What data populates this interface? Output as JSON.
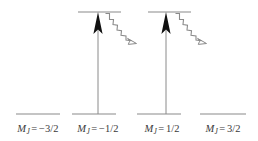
{
  "figure": {
    "type": "energy-level-diagram",
    "title": "",
    "colors": {
      "level_line": "#8a8a8a",
      "excitation_arrow": "#1a1a1a",
      "emission_arrow": "#8a8a8a",
      "label_text": "#3a3a3a",
      "background": "#ffffff"
    },
    "sublevels": [
      {
        "id": "mj-minus-3-2",
        "m_symbol": "M",
        "m_subscript": "J",
        "equals": "=",
        "value": "−3/2",
        "label_text": "M_J = −3/2",
        "ground_line": {
          "x1": 16,
          "x2": 60,
          "y": 114
        },
        "excited_line": null,
        "has_excitation_arrow": false,
        "has_emission_arrow": false,
        "label_center_x": 38,
        "label_y": 124
      },
      {
        "id": "mj-minus-1-2",
        "m_symbol": "M",
        "m_subscript": "J",
        "equals": "=",
        "value": "−1/2",
        "label_text": "M_J = −1/2",
        "ground_line": {
          "x1": 72,
          "x2": 116,
          "y": 114
        },
        "excited_line": {
          "x1": 78,
          "x2": 121,
          "y": 12
        },
        "has_excitation_arrow": true,
        "has_emission_arrow": true,
        "arrow_x": 98,
        "arrow_y_bottom": 114,
        "arrow_y_top": 12,
        "emission": {
          "x1": 105,
          "y1": 13,
          "x2": 136,
          "y2": 40
        },
        "label_center_x": 98,
        "label_y": 124
      },
      {
        "id": "mj-plus-1-2",
        "m_symbol": "M",
        "m_subscript": "J",
        "equals": "=",
        "value": "1/2",
        "label_text": "M_J = 1/2",
        "ground_line": {
          "x1": 137,
          "x2": 181,
          "y": 114
        },
        "excited_line": {
          "x1": 148,
          "x2": 191,
          "y": 12
        },
        "has_excitation_arrow": true,
        "has_emission_arrow": true,
        "arrow_x": 166,
        "arrow_y_bottom": 114,
        "arrow_y_top": 12,
        "emission": {
          "x1": 175,
          "y1": 13,
          "x2": 206,
          "y2": 40
        },
        "label_center_x": 162,
        "label_y": 124
      },
      {
        "id": "mj-plus-3-2",
        "m_symbol": "M",
        "m_subscript": "J",
        "equals": "=",
        "value": "3/2",
        "label_text": "M_J = 3/2",
        "ground_line": {
          "x1": 200,
          "x2": 246,
          "y": 114
        },
        "excited_line": null,
        "has_excitation_arrow": false,
        "has_emission_arrow": false,
        "label_center_x": 222,
        "label_y": 124
      }
    ]
  }
}
